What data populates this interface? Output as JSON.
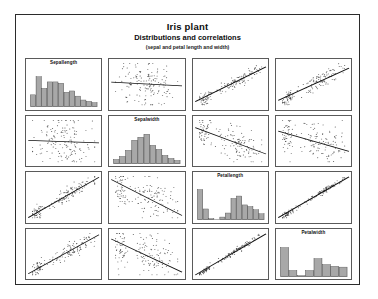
{
  "figure": {
    "title": "Iris plant",
    "subtitle": "Distributions and correlations",
    "subsubtitle": "(sepal and petal length and width)",
    "border_color": "#2b2b2b",
    "background": "#ffffff"
  },
  "style": {
    "point_color": "#3c3c3c",
    "line_color": "#101010",
    "bar_fill": "#a8a8a8",
    "bar_stroke": "#4a4a4a",
    "panel_border": "#5a5a5a"
  },
  "chart_data": {
    "type": "scatter",
    "title": "Iris plant",
    "subtitle": "Distributions and correlations",
    "annotation": "(sepal and petal length and width)",
    "layout": "scatterplot-matrix",
    "rows": 4,
    "cols": 4,
    "grid": false,
    "legend": "none",
    "variables": [
      "Sepallength",
      "Sepalwidth",
      "Petallength",
      "Petalwidth"
    ],
    "diagonal": "histogram",
    "offdiagonal": "scatter with fitted regression line",
    "histograms": [
      {
        "variable": "Sepallength",
        "label": "Sepallength",
        "bins": [
          4.3,
          4.8,
          5.1,
          5.4,
          5.7,
          6.0,
          6.3,
          6.6,
          6.9,
          7.2,
          7.5,
          7.9
        ],
        "counts": [
          9,
          23,
          14,
          19,
          19,
          18,
          11,
          12,
          8,
          5,
          4,
          3
        ],
        "ylim": [
          0,
          25
        ]
      },
      {
        "variable": "Sepalwidth",
        "label": "Sepalwidth",
        "bins": [
          2.0,
          2.3,
          2.6,
          2.8,
          3.0,
          3.2,
          3.4,
          3.6,
          3.8,
          4.0,
          4.4
        ],
        "counts": [
          4,
          7,
          13,
          23,
          26,
          29,
          18,
          14,
          8,
          5,
          3
        ],
        "ylim": [
          0,
          32
        ]
      },
      {
        "variable": "Petallength",
        "label": "Petallength",
        "bins": [
          1.0,
          1.5,
          2.0,
          2.5,
          3.0,
          3.5,
          4.0,
          4.5,
          5.0,
          5.5,
          6.0,
          6.9
        ],
        "counts": [
          37,
          13,
          1,
          0,
          3,
          8,
          26,
          29,
          18,
          16,
          12,
          7
        ],
        "ylim": [
          0,
          40
        ]
      },
      {
        "variable": "Petalwidth",
        "label": "Petalwidth",
        "bins": [
          0.1,
          0.4,
          0.7,
          1.0,
          1.3,
          1.6,
          1.9,
          2.2,
          2.5
        ],
        "counts": [
          34,
          7,
          1,
          7,
          21,
          14,
          12,
          11
        ],
        "ylim": [
          0,
          38
        ]
      }
    ],
    "scatter_cells": [
      {
        "row": 0,
        "col": 1,
        "x": "Sepallength",
        "y": "Sepalwidth",
        "correlation": -0.12,
        "slope": -0.09,
        "intercept": 0.55,
        "cluster": "diffuse",
        "n": 150
      },
      {
        "row": 0,
        "col": 2,
        "x": "Sepallength",
        "y": "Petallength",
        "correlation": 0.87,
        "slope": 0.82,
        "intercept": 0.09,
        "cluster": "two-group",
        "n": 150
      },
      {
        "row": 0,
        "col": 3,
        "x": "Sepallength",
        "y": "Petalwidth",
        "correlation": 0.82,
        "slope": 0.76,
        "intercept": 0.12,
        "cluster": "two-group",
        "n": 150
      },
      {
        "row": 1,
        "col": 0,
        "x": "Sepalwidth",
        "y": "Sepallength",
        "correlation": -0.12,
        "slope": -0.06,
        "intercept": 0.52,
        "cluster": "diffuse",
        "n": 150
      },
      {
        "row": 1,
        "col": 2,
        "x": "Sepalwidth",
        "y": "Petallength",
        "correlation": -0.43,
        "slope": -0.62,
        "intercept": 0.82,
        "cluster": "two-group",
        "n": 150
      },
      {
        "row": 1,
        "col": 3,
        "x": "Sepalwidth",
        "y": "Petalwidth",
        "correlation": -0.37,
        "slope": -0.48,
        "intercept": 0.74,
        "cluster": "two-group",
        "n": 150
      },
      {
        "row": 2,
        "col": 0,
        "x": "Petallength",
        "y": "Sepallength",
        "correlation": 0.87,
        "slope": 0.95,
        "intercept": 0.02,
        "cluster": "two-group",
        "n": 150
      },
      {
        "row": 2,
        "col": 1,
        "x": "Petallength",
        "y": "Sepalwidth",
        "correlation": -0.43,
        "slope": -0.85,
        "intercept": 0.92,
        "cluster": "two-group",
        "n": 150
      },
      {
        "row": 2,
        "col": 3,
        "x": "Petallength",
        "y": "Petalwidth",
        "correlation": 0.96,
        "slope": 0.96,
        "intercept": 0.02,
        "cluster": "tight-two-group",
        "n": 150
      },
      {
        "row": 3,
        "col": 0,
        "x": "Petalwidth",
        "y": "Sepallength",
        "correlation": 0.82,
        "slope": 0.92,
        "intercept": 0.04,
        "cluster": "two-group",
        "n": 150
      },
      {
        "row": 3,
        "col": 1,
        "x": "Petalwidth",
        "y": "Sepalwidth",
        "correlation": -0.37,
        "slope": -0.78,
        "intercept": 0.86,
        "cluster": "two-group",
        "n": 150
      },
      {
        "row": 3,
        "col": 2,
        "x": "Petalwidth",
        "y": "Petallength",
        "correlation": 0.96,
        "slope": 0.97,
        "intercept": 0.01,
        "cluster": "tight-two-group",
        "n": 150
      }
    ]
  }
}
